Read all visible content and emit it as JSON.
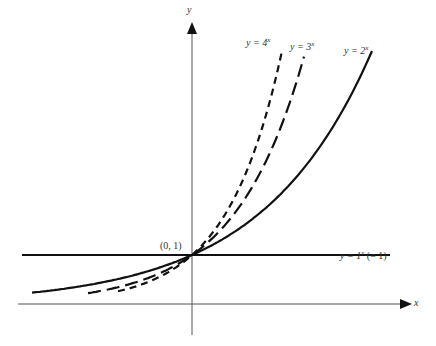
{
  "chart_data": {
    "type": "line",
    "title": "",
    "xlabel": "x",
    "ylabel": "y",
    "grid": false,
    "legend": "inline labels",
    "series": [
      {
        "name": "y = 4^x",
        "label_base": "y = 4",
        "label_exp": "x",
        "base": 4,
        "style": "short-dash"
      },
      {
        "name": "y = 3^x",
        "label_base": "y = 3",
        "label_exp": "x",
        "base": 3,
        "style": "long-dash"
      },
      {
        "name": "y = 2^x",
        "label_base": "y = 2",
        "label_exp": "x",
        "base": 2,
        "style": "solid"
      },
      {
        "name": "y = 1^x (= 1)",
        "label_base": "y = 1",
        "label_exp": "x",
        "label_suffix": " (= 1)",
        "base": 1,
        "style": "solid"
      }
    ],
    "annotations": [
      {
        "text": "(0, 1)",
        "x": 0,
        "y": 1
      }
    ],
    "xlim": [
      -2.1,
      2.8
    ],
    "ylim": [
      -0.6,
      5.2
    ]
  },
  "axes": {
    "x_label": "x",
    "y_label": "y"
  },
  "point_label": "(0, 1)",
  "layout": {
    "origin_x": 192,
    "origin_y": 304,
    "x_scale": 76,
    "y_scale": 49,
    "top_y": 50,
    "left_x": 32
  }
}
